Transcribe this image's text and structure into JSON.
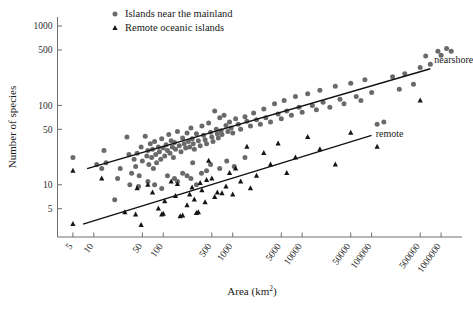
{
  "chart_data": {
    "type": "scatter",
    "title": "",
    "xlabel": "Area (km2)",
    "xlabel_base": "Area (km",
    "xlabel_sup": "2",
    "xlabel_close": ")",
    "ylabel": "Number of species",
    "xscale": "log",
    "yscale": "log",
    "xlim": [
      3,
      2000000
    ],
    "ylim": [
      2.2,
      1300
    ],
    "grid": false,
    "legend_position": "top-center",
    "xticks": [
      5,
      10,
      50,
      100,
      500,
      1000,
      5000,
      10000,
      50000,
      100000,
      500000,
      1000000
    ],
    "xticklabels": [
      "5",
      "10",
      "50",
      "100",
      "500",
      "1000",
      "5000",
      "10000",
      "50000",
      "100000",
      "500000",
      "1000000"
    ],
    "yticks": [
      5,
      10,
      50,
      100,
      500,
      1000
    ],
    "yticklabels": [
      "5",
      "10",
      "50",
      "100",
      "500",
      "1000"
    ],
    "series": [
      {
        "name": "Islands near the mainland",
        "marker": "circle",
        "color": "#6a6a6a",
        "points": [
          [
            5,
            22
          ],
          [
            11,
            18
          ],
          [
            13,
            16
          ],
          [
            14,
            27
          ],
          [
            15,
            19
          ],
          [
            20,
            6.5
          ],
          [
            22,
            12
          ],
          [
            24,
            16
          ],
          [
            30,
            40
          ],
          [
            32,
            24
          ],
          [
            35,
            14
          ],
          [
            38,
            21
          ],
          [
            40,
            17
          ],
          [
            42,
            25
          ],
          [
            45,
            13
          ],
          [
            48,
            30
          ],
          [
            50,
            20
          ],
          [
            55,
            41
          ],
          [
            58,
            23
          ],
          [
            60,
            27
          ],
          [
            62,
            18
          ],
          [
            65,
            33
          ],
          [
            68,
            22
          ],
          [
            70,
            28
          ],
          [
            72,
            16
          ],
          [
            75,
            35
          ],
          [
            78,
            24
          ],
          [
            80,
            19
          ],
          [
            85,
            30
          ],
          [
            88,
            26
          ],
          [
            92,
            21
          ],
          [
            95,
            38
          ],
          [
            100,
            29
          ],
          [
            105,
            23
          ],
          [
            110,
            32
          ],
          [
            115,
            27
          ],
          [
            120,
            43
          ],
          [
            125,
            25
          ],
          [
            130,
            36
          ],
          [
            135,
            30
          ],
          [
            140,
            22
          ],
          [
            145,
            34
          ],
          [
            150,
            28
          ],
          [
            160,
            47
          ],
          [
            170,
            31
          ],
          [
            180,
            26
          ],
          [
            190,
            39
          ],
          [
            200,
            33
          ],
          [
            210,
            29
          ],
          [
            220,
            45
          ],
          [
            230,
            35
          ],
          [
            240,
            30
          ],
          [
            250,
            52
          ],
          [
            260,
            38
          ],
          [
            270,
            33
          ],
          [
            280,
            28
          ],
          [
            300,
            44
          ],
          [
            320,
            36
          ],
          [
            340,
            31
          ],
          [
            360,
            55
          ],
          [
            380,
            42
          ],
          [
            400,
            37
          ],
          [
            420,
            33
          ],
          [
            450,
            60
          ],
          [
            480,
            46
          ],
          [
            500,
            40
          ],
          [
            520,
            35
          ],
          [
            550,
            85
          ],
          [
            580,
            50
          ],
          [
            600,
            44
          ],
          [
            620,
            39
          ],
          [
            650,
            70
          ],
          [
            680,
            48
          ],
          [
            700,
            43
          ],
          [
            750,
            75
          ],
          [
            800,
            56
          ],
          [
            850,
            47
          ],
          [
            900,
            62
          ],
          [
            950,
            52
          ],
          [
            1000,
            45
          ],
          [
            1100,
            68
          ],
          [
            1200,
            58
          ],
          [
            1300,
            50
          ],
          [
            1500,
            72
          ],
          [
            1600,
            63
          ],
          [
            1800,
            55
          ],
          [
            2000,
            80
          ],
          [
            2200,
            66
          ],
          [
            2500,
            58
          ],
          [
            2800,
            90
          ],
          [
            3000,
            70
          ],
          [
            3500,
            62
          ],
          [
            4000,
            105
          ],
          [
            4500,
            78
          ],
          [
            5000,
            68
          ],
          [
            5500,
            115
          ],
          [
            6000,
            85
          ],
          [
            7000,
            75
          ],
          [
            8000,
            130
          ],
          [
            9000,
            95
          ],
          [
            10000,
            82
          ],
          [
            12000,
            140
          ],
          [
            14000,
            100
          ],
          [
            16000,
            88
          ],
          [
            18000,
            155
          ],
          [
            20000,
            110
          ],
          [
            25000,
            95
          ],
          [
            30000,
            175
          ],
          [
            35000,
            120
          ],
          [
            40000,
            105
          ],
          [
            50000,
            190
          ],
          [
            60000,
            130
          ],
          [
            70000,
            115
          ],
          [
            80000,
            210
          ],
          [
            100000,
            145
          ],
          [
            120000,
            58
          ],
          [
            150000,
            62
          ],
          [
            200000,
            230
          ],
          [
            250000,
            160
          ],
          [
            300000,
            250
          ],
          [
            400000,
            185
          ],
          [
            500000,
            300
          ],
          [
            600000,
            420
          ],
          [
            700000,
            330
          ],
          [
            900000,
            480
          ],
          [
            1000000,
            430
          ],
          [
            1200000,
            520
          ],
          [
            1400000,
            480
          ],
          [
            160,
            11
          ],
          [
            190,
            14
          ],
          [
            250,
            12
          ],
          [
            300,
            10
          ],
          [
            95,
            9
          ],
          [
            145,
            12
          ],
          [
            420,
            15
          ],
          [
            60,
            11
          ],
          [
            75,
            10
          ],
          [
            220,
            13
          ],
          [
            480,
            18
          ],
          [
            650,
            16
          ],
          [
            820,
            20
          ],
          [
            1050,
            17
          ],
          [
            1500,
            22
          ],
          [
            33,
            10
          ],
          [
            44,
            9.5
          ],
          [
            115,
            13
          ],
          [
            265,
            19
          ],
          [
            355,
            14
          ]
        ]
      },
      {
        "name": "Remote oceanic islands",
        "marker": "triangle",
        "color": "#151515",
        "points": [
          [
            5,
            15
          ],
          [
            5,
            3.2
          ],
          [
            13,
            12
          ],
          [
            40,
            4.2
          ],
          [
            42,
            9
          ],
          [
            48,
            3.1
          ],
          [
            60,
            10
          ],
          [
            70,
            8
          ],
          [
            95,
            4.2
          ],
          [
            100,
            4.3
          ],
          [
            105,
            6.2
          ],
          [
            130,
            11
          ],
          [
            150,
            7.2
          ],
          [
            175,
            4.0
          ],
          [
            190,
            4.1
          ],
          [
            220,
            5.5
          ],
          [
            240,
            7.5
          ],
          [
            280,
            6.5
          ],
          [
            300,
            4.4
          ],
          [
            320,
            4.5
          ],
          [
            360,
            8.5
          ],
          [
            400,
            6.0
          ],
          [
            450,
            20
          ],
          [
            500,
            12
          ],
          [
            550,
            7.0
          ],
          [
            600,
            8.0
          ],
          [
            700,
            7.8
          ],
          [
            800,
            9.5
          ],
          [
            900,
            14
          ],
          [
            1000,
            7.5
          ],
          [
            1300,
            11
          ],
          [
            1600,
            30
          ],
          [
            1800,
            9.0
          ],
          [
            2200,
            13
          ],
          [
            2800,
            25
          ],
          [
            3500,
            18
          ],
          [
            4500,
            33
          ],
          [
            6000,
            14
          ],
          [
            8000,
            22
          ],
          [
            12000,
            40
          ],
          [
            18000,
            28
          ],
          [
            30000,
            18
          ],
          [
            50000,
            45
          ],
          [
            120000,
            30
          ],
          [
            500000,
            115
          ],
          [
            28,
            4.5
          ],
          [
            85,
            5.0
          ],
          [
            260,
            9.2
          ],
          [
            340,
            10.5
          ],
          [
            420,
            11.5
          ],
          [
            160,
            10.2
          ],
          [
            1100,
            16
          ]
        ]
      }
    ],
    "trendlines": [
      {
        "name": "nearshore",
        "label": "nearshore",
        "x_start": 8,
        "y_start": 16,
        "x_end": 700000,
        "y_end": 290
      },
      {
        "name": "remote",
        "label": "remote",
        "x_start": 7,
        "y_start": 3.2,
        "x_end": 100000,
        "y_end": 42
      }
    ],
    "legend": [
      {
        "marker": "circle",
        "label": "Islands near the mainland"
      },
      {
        "marker": "triangle",
        "label": "Remote oceanic islands"
      }
    ]
  },
  "colors": {
    "nearshore_marker": "#6a6a6a",
    "remote_marker": "#151515",
    "trend_line": "#111111",
    "axis": "#6e6e6e",
    "text": "#1a1a1a",
    "background": "#ffffff"
  }
}
